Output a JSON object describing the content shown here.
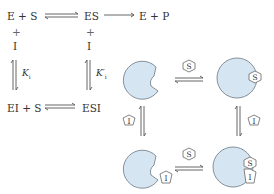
{
  "scheme": {
    "top_left": "E + S",
    "top_mid": "ES",
    "top_right": "E + P",
    "plus_left": "+",
    "plus_mid": "+",
    "inhib_left": "I",
    "inhib_mid": "I",
    "k_left": "K",
    "k_left_sub": "i",
    "k_right": "K′",
    "k_right_sub": "i",
    "bottom_left": "EI + S",
    "bottom_right": "ESI"
  },
  "cartoon": {
    "substrate_label": "S",
    "inhibitor_label": "I",
    "enzyme_color": "#d5e6f2",
    "enzyme_stroke": "#7a8590"
  }
}
